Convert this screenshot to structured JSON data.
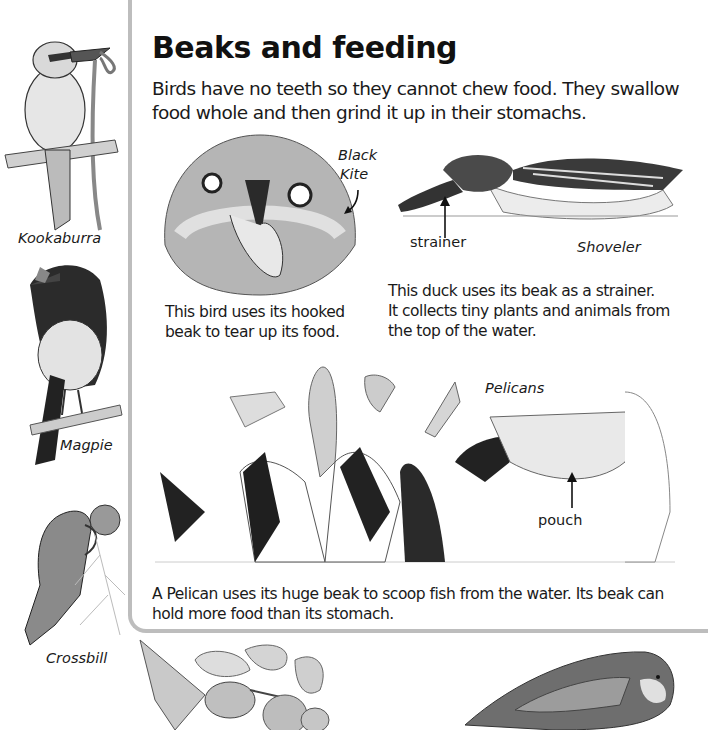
{
  "page": {
    "title": "Beaks and feeding",
    "intro": "Birds have no teeth so they cannot chew food. They swallow food whole and then grind it up in their stomachs."
  },
  "sidebar_birds": [
    {
      "name": "Kookaburra"
    },
    {
      "name": "Magpie"
    },
    {
      "name": "Crossbill"
    }
  ],
  "sections": {
    "kite": {
      "label": "Black Kite",
      "label_line1": "Black",
      "label_line2": "Kite",
      "caption_line1": "This bird uses its hooked",
      "caption_line2": "beak to tear up its food."
    },
    "shoveler": {
      "label": "Shoveler",
      "part_label": "strainer",
      "caption_line1": "This duck uses its beak as a strainer.",
      "caption_line2": "It collects tiny plants and animals from",
      "caption_line3": "the top of the water."
    },
    "pelicans": {
      "label": "Pelicans",
      "part_label": "pouch",
      "caption_line1": "A Pelican uses its huge beak to scoop fish from the water. Its beak can",
      "caption_line2": "hold more food than its stomach."
    }
  },
  "bottom_illustrations": [
    {
      "subject": "hummingbird with flower"
    },
    {
      "subject": "parrot"
    }
  ],
  "colors": {
    "text": "#1a1a1a",
    "panel_border": "#bdbdbd",
    "ink_dark": "#2a2a2a",
    "ink_mid": "#7a7a7a",
    "ink_light": "#c8c8c8"
  }
}
